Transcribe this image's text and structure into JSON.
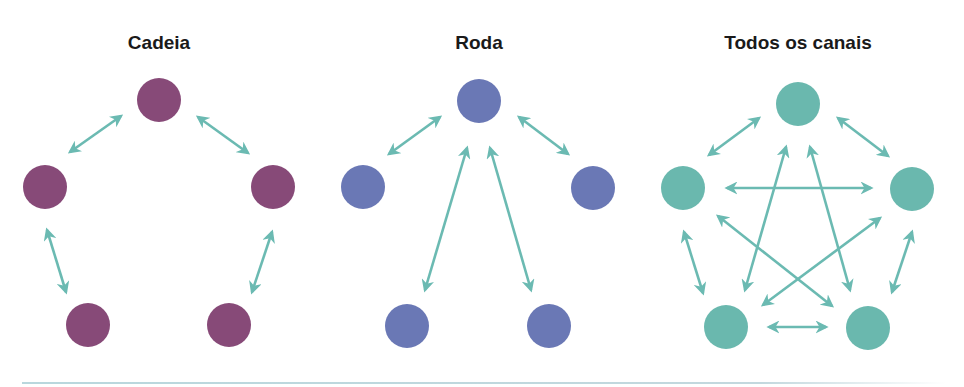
{
  "colors": {
    "chain": "#874a78",
    "wheel": "#6a78b5",
    "all_channel": "#6ab8ae",
    "arrow": "#6bbab2",
    "rule": "#b9d7dd"
  },
  "diagrams": [
    {
      "title": "Cadeia",
      "title_x": 159,
      "node_color_key": "chain",
      "nodes": [
        [
          159,
          100
        ],
        [
          45,
          187
        ],
        [
          273,
          187
        ],
        [
          88,
          325
        ],
        [
          229,
          325
        ]
      ],
      "arrows": [
        [
          70,
          152,
          121,
          116
        ],
        [
          198,
          117,
          248,
          153
        ],
        [
          47,
          230,
          66,
          292
        ],
        [
          272,
          232,
          252,
          292
        ]
      ]
    },
    {
      "title": "Roda",
      "title_x": 479,
      "node_color_key": "wheel",
      "nodes": [
        [
          479,
          101
        ],
        [
          363,
          187
        ],
        [
          593,
          188
        ],
        [
          407,
          326
        ],
        [
          549,
          326
        ]
      ],
      "arrows": [
        [
          389,
          154,
          440,
          117
        ],
        [
          519,
          117,
          568,
          154
        ],
        [
          467,
          148,
          425,
          290
        ],
        [
          490,
          148,
          531,
          290
        ]
      ]
    },
    {
      "title": "Todos os canais",
      "title_x": 798,
      "node_color_key": "all_channel",
      "nodes": [
        [
          798,
          104
        ],
        [
          683,
          188
        ],
        [
          912,
          189
        ],
        [
          726,
          327
        ],
        [
          868,
          328
        ]
      ],
      "arrows": [
        [
          709,
          155,
          759,
          118
        ],
        [
          838,
          118,
          888,
          156
        ],
        [
          727,
          188,
          871,
          188
        ],
        [
          786,
          147,
          745,
          290
        ],
        [
          810,
          147,
          850,
          290
        ],
        [
          718,
          216,
          832,
          306
        ],
        [
          880,
          218,
          763,
          305
        ],
        [
          684,
          232,
          703,
          293
        ],
        [
          912,
          232,
          892,
          292
        ],
        [
          769,
          327,
          826,
          327
        ]
      ]
    }
  ],
  "node_radius": 22
}
